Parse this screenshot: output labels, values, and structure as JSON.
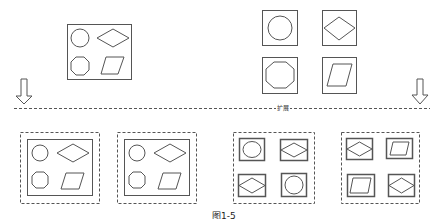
{
  "diagram": {
    "divider_label": "扩展",
    "caption": "图1-5",
    "colors": {
      "stroke": "#555555",
      "background": "#ffffff"
    },
    "top_left_group": {
      "frame": "solid",
      "shapes": [
        "circle",
        "diamond",
        "octagon",
        "parallelogram"
      ]
    },
    "top_right_group": {
      "frame": "none",
      "cells": [
        {
          "shape": "circle"
        },
        {
          "shape": "diamond"
        },
        {
          "shape": "octagon"
        },
        {
          "shape": "parallelogram"
        }
      ]
    },
    "arrows": [
      {
        "position": "left",
        "direction": "down"
      },
      {
        "position": "right",
        "direction": "down"
      }
    ],
    "bottom_groups": [
      {
        "frame": "dashed+solid",
        "shapes": [
          "circle",
          "diamond",
          "octagon",
          "parallelogram"
        ]
      },
      {
        "frame": "dashed+solid",
        "shapes": [
          "circle",
          "diamond",
          "octagon",
          "parallelogram"
        ]
      },
      {
        "frame": "dashed",
        "cells": [
          "circle",
          "diamond",
          "diamond",
          "circle"
        ]
      },
      {
        "frame": "dashed",
        "cells": [
          "diamond",
          "parallelogram",
          "parallelogram",
          "diamond"
        ]
      }
    ]
  }
}
